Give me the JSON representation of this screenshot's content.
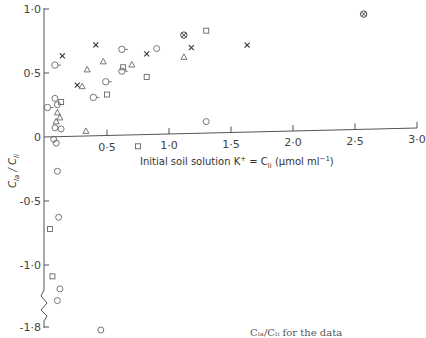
{
  "chart_data": {
    "type": "scatter",
    "title": "",
    "xlabel": "Initial soil solution K⁺ = Cₗᵢ (μmol ml⁻¹)",
    "xlabel_parts": {
      "main": "Initial soil solution K",
      "sup": "+",
      "eq": " = C",
      "sub": "li",
      "unit": "  (μmol ml",
      "unit_sup": "−1",
      "unit_end": ")"
    },
    "ylabel": "C_la / C_li",
    "ylabel_parts": {
      "c1": "C",
      "s1": "la",
      "slash": " / ",
      "c2": "C",
      "s2": "li"
    },
    "xlim": [
      0,
      3.0
    ],
    "ylim": [
      -1.8,
      1.0
    ],
    "x_ticks": [
      {
        "value": 0.5,
        "label": "0·5"
      },
      {
        "value": 1.0,
        "label": "1·0"
      },
      {
        "value": 1.5,
        "label": "1·5"
      },
      {
        "value": 2.0,
        "label": "2·0"
      },
      {
        "value": 2.5,
        "label": "2·5"
      },
      {
        "value": 3.0,
        "label": "3·0"
      }
    ],
    "y_ticks": [
      {
        "value": 1.0,
        "label": "1·0"
      },
      {
        "value": 0.5,
        "label": "0·5"
      },
      {
        "value": 0,
        "label": "0"
      },
      {
        "value": -0.5,
        "label": "-0·5"
      },
      {
        "value": -1.0,
        "label": "-1·0"
      },
      {
        "value": -1.8,
        "label": "-1·8"
      }
    ],
    "axis_break": {
      "axis": "y",
      "between": [
        -1.3,
        -1.75
      ]
    },
    "grid": false,
    "legend": null,
    "series": [
      {
        "name": "circle",
        "marker": "circle",
        "points": [
          [
            0.08,
            0.3
          ],
          [
            0.1,
            0.25
          ],
          [
            0.08,
            0.07
          ],
          [
            0.13,
            0.06
          ],
          [
            0.07,
            -0.02
          ],
          [
            0.09,
            -0.05
          ],
          [
            0.1,
            -0.27
          ],
          [
            0.11,
            -0.63
          ],
          [
            0.12,
            -1.19
          ],
          [
            0.1,
            -1.28
          ],
          [
            0.45,
            -1.85
          ],
          [
            0.9,
            0.67
          ],
          [
            1.3,
            0.09
          ]
        ]
      },
      {
        "name": "circle-with-tick",
        "marker": "circle-tick",
        "points": [
          [
            0.02,
            0.23
          ],
          [
            0.08,
            0.56
          ],
          [
            0.39,
            0.3
          ],
          [
            0.49,
            0.42
          ],
          [
            0.62,
            0.67
          ],
          [
            0.62,
            0.5
          ]
        ]
      },
      {
        "name": "square",
        "marker": "square",
        "points": [
          [
            0.13,
            0.27
          ],
          [
            0.5,
            0.32
          ],
          [
            0.63,
            0.53
          ],
          [
            0.82,
            0.45
          ],
          [
            0.75,
            -0.09
          ],
          [
            1.3,
            0.8
          ],
          [
            0.04,
            -0.72
          ],
          [
            0.06,
            -1.09
          ]
        ]
      },
      {
        "name": "triangle",
        "marker": "triangle",
        "points": [
          [
            0.1,
            0.19
          ],
          [
            0.12,
            0.15
          ],
          [
            0.09,
            0.12
          ],
          [
            0.33,
            0.04
          ],
          [
            0.34,
            0.52
          ],
          [
            0.47,
            0.58
          ],
          [
            0.7,
            0.55
          ],
          [
            1.12,
            0.6
          ],
          [
            0.3,
            0.39
          ]
        ]
      },
      {
        "name": "cross",
        "marker": "x",
        "points": [
          [
            0.14,
            0.63
          ],
          [
            0.26,
            0.4
          ],
          [
            0.41,
            0.71
          ],
          [
            0.82,
            0.63
          ],
          [
            1.18,
            0.67
          ],
          [
            1.63,
            0.68
          ]
        ]
      },
      {
        "name": "circled-cross",
        "marker": "circle-x",
        "points": [
          [
            1.12,
            0.77
          ],
          [
            2.57,
            0.9
          ]
        ]
      }
    ]
  },
  "caption": {
    "text": "Cₗₐ/Cₗᵢ for the data"
  }
}
